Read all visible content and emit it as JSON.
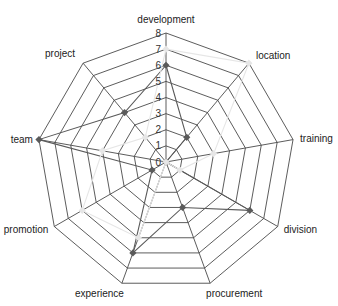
{
  "chart_data": {
    "type": "radar",
    "title": "",
    "categories": [
      "development",
      "location",
      "training",
      "division",
      "procurement",
      "experience",
      "promotion",
      "team",
      "project"
    ],
    "series": [
      {
        "name": "Series 1",
        "color": "#5a5a5a",
        "marker": "diamond",
        "values": [
          6,
          2,
          0,
          6,
          3,
          6,
          1,
          8,
          4
        ]
      },
      {
        "name": "Series 2",
        "color": "#e6e6e6",
        "marker": "diamond",
        "values": [
          7,
          8,
          3,
          1,
          0,
          5,
          6,
          4,
          2
        ]
      }
    ],
    "radial_ticks": [
      0,
      1,
      2,
      3,
      4,
      5,
      6,
      7,
      8
    ],
    "rlim": [
      0,
      8
    ],
    "grid": true,
    "legend": "none"
  },
  "colors": {
    "grid": "#4a4a4a",
    "text": "#222222",
    "background": "#ffffff"
  }
}
